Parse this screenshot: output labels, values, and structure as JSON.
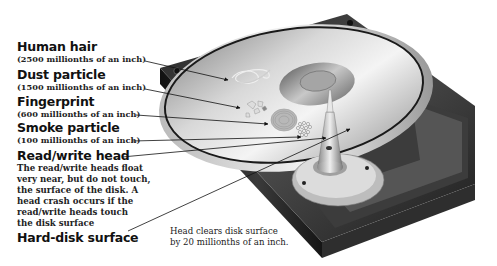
{
  "labels": [
    {
      "id": "human-hair",
      "title": "Human hair",
      "sub": "(2500 millionths of an inch)"
    },
    {
      "id": "dust-particle",
      "title": "Dust particle",
      "sub": "(1500 millionths of an inch)"
    },
    {
      "id": "fingerprint",
      "title": "Fingerprint",
      "sub": "(600 millionths of an inch)"
    },
    {
      "id": "smoke-particle",
      "title": "Smoke particle",
      "sub": "(100 millionths of an inch)"
    },
    {
      "id": "read-write-head",
      "title": "Read/write head",
      "desc_lines": [
        "The read/write heads float",
        "very near, but do not touch,",
        "the surface of the disk. A",
        "head crash occurs if the",
        "read/write heads touch",
        "the disk surface"
      ]
    },
    {
      "id": "hard-disk-surface",
      "title": "Hard-disk surface"
    }
  ],
  "caption_lines": [
    "Head clears disk surface",
    "by 20 millionths of an inch."
  ]
}
